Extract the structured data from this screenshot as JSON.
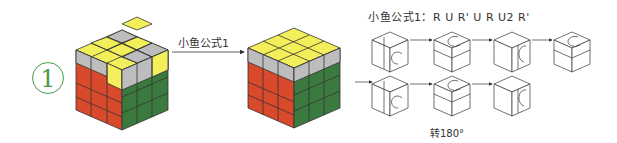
{
  "step": {
    "number": "1"
  },
  "arrow": {
    "label": "小鱼公式1"
  },
  "formula": {
    "label": "小鱼公式1：",
    "moves": "R U R' U R U2 R'"
  },
  "rotate_note": {
    "label": "转180°"
  },
  "colors": {
    "yellow": "#f2ef5a",
    "gray": "#bdbdbd",
    "red": "#d9492b",
    "green": "#3a7a3e",
    "accent": "#4a9a4a"
  },
  "move_sequence": [
    {
      "row": 1,
      "move": "R",
      "face": "right",
      "direction": "up"
    },
    {
      "row": 1,
      "move": "U",
      "face": "top",
      "direction": "counterclockwise"
    },
    {
      "row": 1,
      "move": "R'",
      "face": "right",
      "direction": "down"
    },
    {
      "row": 1,
      "move": "U",
      "face": "top",
      "direction": "counterclockwise"
    },
    {
      "row": 2,
      "move": "R",
      "face": "right",
      "direction": "up"
    },
    {
      "row": 2,
      "move": "U2",
      "face": "top",
      "direction": "half-turn"
    },
    {
      "row": 2,
      "move": "R'",
      "face": "right",
      "direction": "down"
    }
  ]
}
